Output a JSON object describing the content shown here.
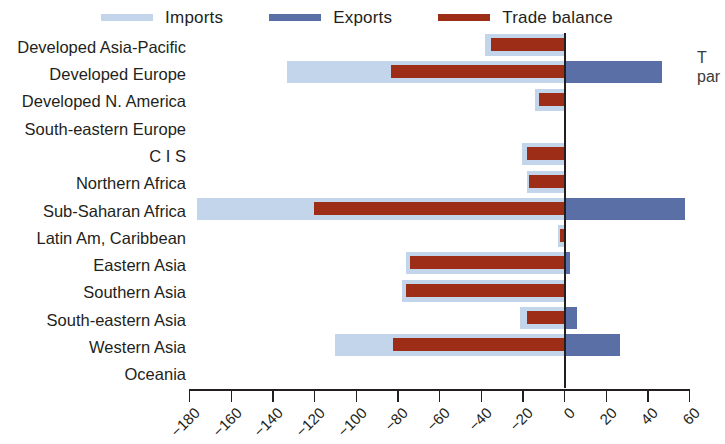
{
  "legend": {
    "items": [
      {
        "label": "Imports",
        "color": "#c3d5ea",
        "key": "imports"
      },
      {
        "label": "Exports",
        "color": "#5a6fa5",
        "key": "exports"
      },
      {
        "label": "Trade balance",
        "color": "#9e2d18",
        "key": "balance"
      }
    ]
  },
  "side_note": {
    "line1": "T",
    "line2": "par"
  },
  "axis": {
    "zero_value": 0,
    "ticks": [
      -180,
      -160,
      -140,
      -120,
      -100,
      -80,
      -60,
      -40,
      -20,
      0,
      20,
      40,
      60
    ],
    "tick_labels": [
      "-180",
      "-160",
      "-140",
      "-120",
      "-100",
      "-80",
      "-60",
      "-40",
      "-20",
      "0",
      "20",
      "40",
      "60"
    ],
    "min": -180,
    "max": 60
  },
  "chart_data": {
    "type": "bar",
    "orientation": "horizontal",
    "title": "",
    "subtitle": "",
    "xlabel": "",
    "ylabel": "",
    "xlim": [
      -180,
      60
    ],
    "grid": false,
    "legend_position": "top-center",
    "categories": [
      "Developed Asia-Pacific",
      "Developed Europe",
      "Developed N. America",
      "South-eastern Europe",
      "C I S",
      "Northern Africa",
      "Sub-Saharan Africa",
      "Latin Am, Caribbean",
      "Eastern Asia",
      "Southern Asia",
      "South-eastern Asia",
      "Western Asia",
      "Oceania"
    ],
    "series": [
      {
        "name": "Imports",
        "color": "#c3d5ea",
        "values": [
          -38,
          -133,
          -14,
          0,
          -20,
          -18,
          -176,
          -3,
          -76,
          -78,
          -21,
          -110,
          0
        ]
      },
      {
        "name": "Exports",
        "color": "#5a6fa5",
        "values": [
          0,
          47,
          1,
          0,
          1,
          1,
          58,
          1,
          3,
          1,
          6,
          27,
          0
        ]
      },
      {
        "name": "Trade balance",
        "color": "#9e2d18",
        "values": [
          -35,
          -83,
          -12,
          0,
          -18,
          -17,
          -120,
          -2,
          -74,
          -76,
          -18,
          -82,
          0
        ]
      }
    ]
  }
}
